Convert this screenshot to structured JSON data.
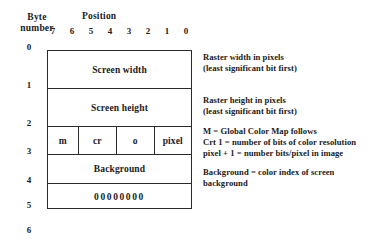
{
  "figure": {
    "header": {
      "byte_number_line1": "Byte",
      "byte_number_line2": "number",
      "position_label": "Position",
      "bit_positions": [
        "7",
        "6",
        "5",
        "4",
        "3",
        "2",
        "1",
        "0"
      ]
    },
    "byte_numbers": [
      "0",
      "1",
      "2",
      "3",
      "4",
      "5",
      "6"
    ],
    "rows": [
      {
        "name": "screen-width",
        "label": "Screen width"
      },
      {
        "name": "screen-height",
        "label": "Screen height"
      },
      {
        "name": "flags",
        "cells": [
          {
            "name": "m",
            "label": "m"
          },
          {
            "name": "cr",
            "label": "cr"
          },
          {
            "name": "o",
            "label": "o"
          },
          {
            "name": "pixel",
            "label": "pixel"
          }
        ]
      },
      {
        "name": "background",
        "label": "Background"
      },
      {
        "name": "zeros",
        "label": "00000000"
      }
    ],
    "annotations": {
      "width": {
        "line1": "Raster width in pixels",
        "line2": "(least significant bit first)"
      },
      "height": {
        "line1": "Raster height in pixels",
        "line2": "(least significant bit first)"
      },
      "flags": {
        "line1": "M = Global Color Map follows",
        "line2": "Crt 1 = number of bits of color resolution",
        "line3": "pixel + 1 = number bits/pixel in image"
      },
      "background": {
        "line1": "Background = color index of screen",
        "line2": "background"
      }
    },
    "colors": {
      "ink": "#1b1b1b",
      "rule": "#2a2a2a",
      "paper": "#ffffff"
    }
  }
}
